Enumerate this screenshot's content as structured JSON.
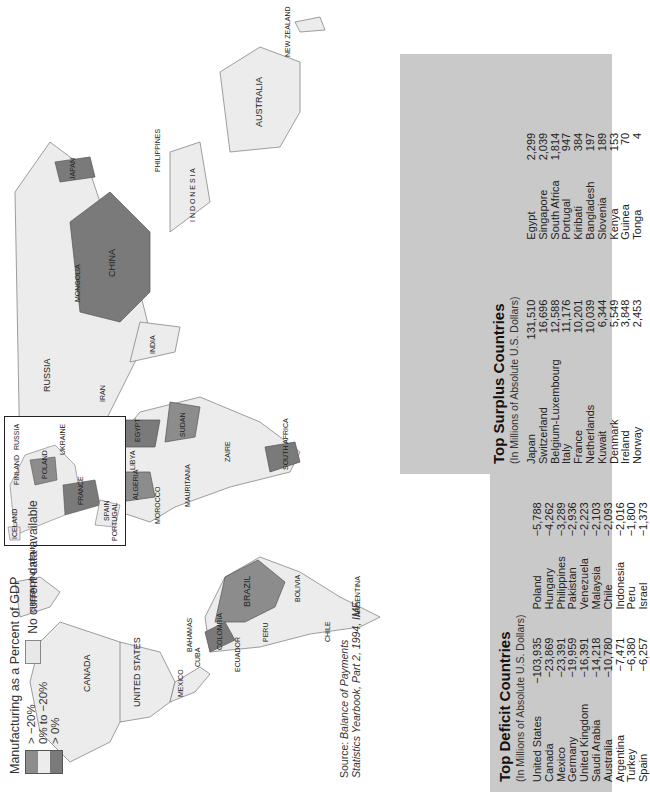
{
  "legend": {
    "title": "Manufacturing as a Percent of GDP",
    "items": [
      {
        "label": "> −20%",
        "color": "#8c8c8c"
      },
      {
        "label": "0% to −20%",
        "color": "#ececec"
      },
      {
        "label": "> 0%",
        "color": "#7a7a7a"
      }
    ],
    "no_data": {
      "label": "No current data available",
      "color": "#e6e6e6"
    }
  },
  "source": {
    "prefix": "Source: ",
    "line1": "Balance of Payments",
    "line2": "Statistics Yearbook, Part 2, 1994, IMF."
  },
  "map": {
    "labels": {
      "canada": "CANADA",
      "united_states": "UNITED STATES",
      "mexico": "MEXICO",
      "greenland": "GREENLAND (DENMARK)",
      "bahamas": "BAHAMAS",
      "cuba": "CUBA",
      "dominican_republic": "DOMINICAN REPUBLIC",
      "colombia": "COLOMBIA",
      "venezuela": "VENEZUELA",
      "guyana": "GUYANA",
      "suriname": "SURINAME",
      "french_guiana": "FRENCH GUIANA",
      "ecuador": "ECUADOR",
      "peru": "PERU",
      "brazil": "BRAZIL",
      "bolivia": "BOLIVIA",
      "chile": "CHILE",
      "argentina": "ARGENTINA",
      "russia": "RUSSIA",
      "mongolia": "MONGOLIA",
      "china": "CHINA",
      "japan": "JAPAN",
      "india": "INDIA",
      "kazakhstan": "KAZAKHSTAN",
      "iran": "IRAN",
      "saudi_arabia": "SAUDI ARABIA",
      "egypt": "EGYPT",
      "libya": "LIBYA",
      "algeria": "ALGERIA",
      "morocco": "MOROCCO",
      "western_sahara": "WESTERN SAHARA",
      "mauritania": "MAURITANIA",
      "mali": "MALI",
      "niger": "NIGER",
      "chad": "CHAD",
      "sudan": "SUDAN",
      "ethiopia": "ETHIOPIA",
      "zaire": "ZAIRE",
      "angola": "ANGOLA",
      "namibia": "NAMIBIA",
      "south_africa": "SOUTH AFRICA",
      "madagascar": "MADAGASCAR",
      "australia": "AUSTRALIA",
      "new_zealand": "NEW ZEALAND",
      "indonesia": "I N D O N E S I A",
      "philippines": "PHILIPPINES",
      "papua_new_guinea": "PAPUA NEW GUINEA",
      "taiwan": "TAIWAN",
      "sri_lanka": "SRI LANKA",
      "cape_verde": "CAPE VERDE ISLANDS"
    },
    "inset_labels": {
      "iceland": "ICELAND",
      "finland": "FINLAND",
      "russia": "RUSSIA",
      "ukraine": "UKRAINE",
      "france": "FRANCE",
      "spain": "SPAIN",
      "portugal": "PORTUGAL",
      "poland": "POLAND",
      "romania": "ROMANIA"
    }
  },
  "deficit": {
    "title": "Top Deficit Countries",
    "subtitle": "(In Millions of Absolute U.S. Dollars)",
    "left": [
      {
        "country": "United States",
        "value": "−103,935"
      },
      {
        "country": "Canada",
        "value": "−23,869"
      },
      {
        "country": "Mexico",
        "value": "−23,391"
      },
      {
        "country": "Germany",
        "value": "−19,959"
      },
      {
        "country": "United Kingdom",
        "value": "−16,391"
      },
      {
        "country": "Saudi Arabia",
        "value": "−14,218"
      },
      {
        "country": "Australia",
        "value": "−10,780"
      },
      {
        "country": "Argentina",
        "value": "−7,471"
      },
      {
        "country": "Turkey",
        "value": "−6,380"
      },
      {
        "country": "Spain",
        "value": "−6,257"
      }
    ],
    "right": [
      {
        "country": "Poland",
        "value": "−5,788"
      },
      {
        "country": "Hungary",
        "value": "−4,262"
      },
      {
        "country": "Philippines",
        "value": "−3,289"
      },
      {
        "country": "Pakistan",
        "value": "−2,936"
      },
      {
        "country": "Venezuela",
        "value": "−2,223"
      },
      {
        "country": "Malaysia",
        "value": "−2,103"
      },
      {
        "country": "Chile",
        "value": "−2,093"
      },
      {
        "country": "Indonesia",
        "value": "−2,016"
      },
      {
        "country": "Peru",
        "value": "−1,800"
      },
      {
        "country": "Israel",
        "value": "−1,373"
      }
    ]
  },
  "surplus": {
    "title": "Top Surplus Countries",
    "subtitle": "(In Millions of Absolute U.S. Dollars)",
    "left": [
      {
        "country": "Japan",
        "value": "131,510"
      },
      {
        "country": "Switzerland",
        "value": "16,696"
      },
      {
        "country": "Belgium-Luxembourg",
        "value": "12,588"
      },
      {
        "country": "Italy",
        "value": "11,176"
      },
      {
        "country": "France",
        "value": "10,201"
      },
      {
        "country": "Netherlands",
        "value": "10,039"
      },
      {
        "country": "Kuwait",
        "value": "6,344"
      },
      {
        "country": "Denmark",
        "value": "5,549"
      },
      {
        "country": "Ireland",
        "value": "3,848"
      },
      {
        "country": "Norway",
        "value": "2,453"
      }
    ],
    "right": [
      {
        "country": "Egypt",
        "value": "2,299"
      },
      {
        "country": "Singapore",
        "value": "2,039"
      },
      {
        "country": "South Africa",
        "value": "1,814"
      },
      {
        "country": "Portugal",
        "value": "947"
      },
      {
        "country": "Kiribati",
        "value": "384"
      },
      {
        "country": "Bangladesh",
        "value": "197"
      },
      {
        "country": "Slovenia",
        "value": "189"
      },
      {
        "country": "Kenya",
        "value": "153"
      },
      {
        "country": "Guinea",
        "value": "70"
      },
      {
        "country": "Tonga",
        "value": "4"
      }
    ]
  }
}
